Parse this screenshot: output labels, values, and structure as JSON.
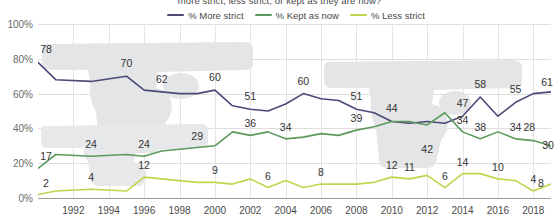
{
  "chart_title": "more strict, less strict, or kept as they are now?",
  "legend": {
    "position": "top-center",
    "items": [
      {
        "label": "% More strict",
        "color": "#4c4a77",
        "name": "more-strict"
      },
      {
        "label": "% Kept as now",
        "color": "#5b9a5b",
        "name": "kept-as-now"
      },
      {
        "label": "% Less strict",
        "color": "#c3d34e",
        "name": "less-strict"
      }
    ]
  },
  "axes": {
    "y_ticks": [
      "0%",
      "20%",
      "40%",
      "60%",
      "80%",
      "100%"
    ],
    "y_values": [
      0,
      20,
      40,
      60,
      80,
      100
    ],
    "x_ticks": [
      "1992",
      "1994",
      "1996",
      "1998",
      "2000",
      "2002",
      "2004",
      "2006",
      "2008",
      "2010",
      "2012",
      "2014",
      "2016",
      "2018"
    ],
    "x_tick_values": [
      1992,
      1994,
      1996,
      1998,
      2000,
      2002,
      2004,
      2006,
      2008,
      2010,
      2012,
      2014,
      2016,
      2018
    ]
  },
  "chart_data": {
    "type": "line",
    "title": "more strict, less strict, or kept as they are now?",
    "xlabel": "",
    "ylabel": "",
    "ylim": [
      0,
      100
    ],
    "xlim": [
      1990,
      2019
    ],
    "grid": true,
    "legend_position": "top-center",
    "x": [
      1990,
      1991,
      1993,
      1995,
      1996,
      1997,
      1998,
      1999,
      2000,
      2001,
      2002,
      2003,
      2004,
      2005,
      2006,
      2007,
      2008,
      2009,
      2010,
      2011,
      2012,
      2013,
      2014,
      2015,
      2016,
      2017,
      2018,
      2019
    ],
    "series": [
      {
        "name": "% More strict",
        "color": "#4c4a77",
        "values": [
          78,
          68,
          67,
          70,
          62,
          61,
          60,
          60,
          62,
          53,
          51,
          50,
          54,
          60,
          57,
          56,
          51,
          49,
          44,
          43,
          44,
          43,
          47,
          58,
          47,
          55,
          60,
          61
        ]
      },
      {
        "name": "% Kept as now",
        "color": "#5b9a5b",
        "values": [
          17,
          25,
          24,
          25,
          24,
          27,
          28,
          29,
          30,
          38,
          36,
          38,
          34,
          35,
          37,
          36,
          39,
          41,
          44,
          44,
          42,
          49,
          38,
          34,
          38,
          34,
          33,
          30
        ]
      },
      {
        "name": "% Less strict",
        "color": "#c3d34e",
        "values": [
          2,
          4,
          5,
          4,
          12,
          11,
          10,
          9,
          9,
          8,
          11,
          6,
          10,
          6,
          8,
          8,
          8,
          9,
          12,
          11,
          13,
          6,
          14,
          14,
          11,
          10,
          4,
          8
        ]
      }
    ],
    "data_labels": [
      {
        "series": "% More strict",
        "x": 1990,
        "value": 78
      },
      {
        "series": "% More strict",
        "x": 1995,
        "value": 70
      },
      {
        "series": "% More strict",
        "x": 1997,
        "value": 62
      },
      {
        "series": "% More strict",
        "x": 2000,
        "value": 60
      },
      {
        "series": "% More strict",
        "x": 2002,
        "value": 51
      },
      {
        "series": "% More strict",
        "x": 2005,
        "value": 60
      },
      {
        "series": "% More strict",
        "x": 2008,
        "value": 51
      },
      {
        "series": "% More strict",
        "x": 2010,
        "value": 44
      },
      {
        "series": "% More strict",
        "x": 2014,
        "value": 47
      },
      {
        "series": "% More strict",
        "x": 2015,
        "value": 58
      },
      {
        "series": "% More strict",
        "x": 2017,
        "value": 55
      },
      {
        "series": "% More strict",
        "x": 2019,
        "value": 61
      },
      {
        "series": "% Kept as now",
        "x": 1990,
        "value": 17
      },
      {
        "series": "% Kept as now",
        "x": 1993,
        "value": 24
      },
      {
        "series": "% Kept as now",
        "x": 1996,
        "value": 24
      },
      {
        "series": "% Kept as now",
        "x": 1999,
        "value": 29
      },
      {
        "series": "% Kept as now",
        "x": 2002,
        "value": 36
      },
      {
        "series": "% Kept as now",
        "x": 2004,
        "value": 34
      },
      {
        "series": "% Kept as now",
        "x": 2008,
        "value": 39
      },
      {
        "series": "% Kept as now",
        "x": 2012,
        "value": 42
      },
      {
        "series": "% Kept as now",
        "x": 2014,
        "value": 34
      },
      {
        "series": "% Kept as now",
        "x": 2015,
        "value": 38
      },
      {
        "series": "% Kept as now",
        "x": 2017,
        "value": 34
      },
      {
        "series": "% Kept as now",
        "x": 2018,
        "value": 28
      },
      {
        "series": "% Kept as now",
        "x": 2019,
        "value": 30
      },
      {
        "series": "% Less strict",
        "x": 1990,
        "value": 2
      },
      {
        "series": "% Less strict",
        "x": 1993,
        "value": 4
      },
      {
        "series": "% Less strict",
        "x": 1996,
        "value": 12
      },
      {
        "series": "% Less strict",
        "x": 2000,
        "value": 9
      },
      {
        "series": "% Less strict",
        "x": 2003,
        "value": 6
      },
      {
        "series": "% Less strict",
        "x": 2006,
        "value": 8
      },
      {
        "series": "% Less strict",
        "x": 2010,
        "value": 12
      },
      {
        "series": "% Less strict",
        "x": 2011,
        "value": 11
      },
      {
        "series": "% Less strict",
        "x": 2013,
        "value": 6
      },
      {
        "series": "% Less strict",
        "x": 2014,
        "value": 14
      },
      {
        "series": "% Less strict",
        "x": 2016,
        "value": 10
      },
      {
        "series": "% Less strict",
        "x": 2018,
        "value": 4
      },
      {
        "series": "% Less strict",
        "x": 2019,
        "value": 8
      }
    ]
  }
}
